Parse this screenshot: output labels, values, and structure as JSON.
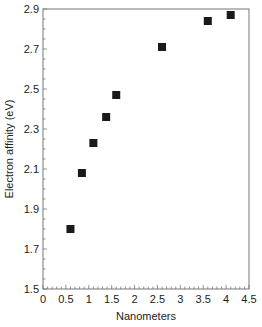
{
  "chart_data": {
    "type": "scatter",
    "title": "",
    "xlabel": "Nanometers",
    "ylabel": "Electron affinity (eV)",
    "xlim": [
      0,
      4.5
    ],
    "ylim": [
      1.5,
      2.9
    ],
    "x_ticks": [
      "0",
      "0.5",
      "1",
      "1.5",
      "2",
      "2.5",
      "3",
      "3.5",
      "4",
      "4.5"
    ],
    "y_ticks": [
      "1.5",
      "1.7",
      "1.9",
      "2.1",
      "2.3",
      "2.5",
      "2.7",
      "2.9"
    ],
    "grid": false,
    "legend": null,
    "marker": "square",
    "marker_color": "#1a1a1a",
    "x": [
      0.6,
      0.85,
      1.1,
      1.38,
      1.6,
      2.6,
      3.6,
      4.1
    ],
    "y": [
      1.8,
      2.08,
      2.23,
      2.36,
      2.47,
      2.71,
      2.84,
      2.87
    ]
  }
}
